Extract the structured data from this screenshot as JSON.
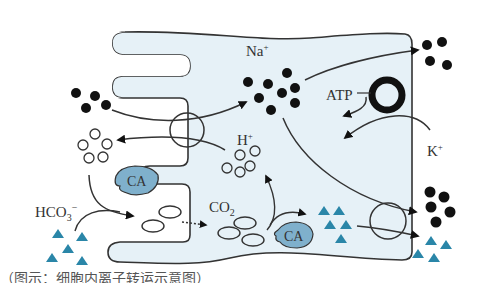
{
  "diagram": {
    "type": "gastric parietal cell ion transport schematic",
    "colors": {
      "cell_fill": "#e6f1f7",
      "outline": "#333333",
      "enzyme_fill": "#7fb0cc",
      "triangle": "#2a86a8",
      "particle": "#111111"
    },
    "labels": {
      "na": "Na",
      "na_sup": "+",
      "h": "H",
      "h_sup": "+",
      "k": "K",
      "k_sup": "+",
      "atp": "ATP",
      "co2_main": "CO",
      "co2_sub": "2",
      "hco3_main": "HCO",
      "hco3_sub": "3",
      "hco3_sup": "−",
      "ca_enzyme_1": "CA",
      "ca_enzyme_2": "CA"
    },
    "legend_symbols": {
      "filled_circle": "Na+ ion",
      "open_circle": "H+ ion",
      "triangle": "HCO3- ion",
      "open_ellipse": "CO2 molecule",
      "thick_ring": "Na+/K+ ATPase pump",
      "thin_ring": "membrane transporter"
    },
    "caption": "（图示：细胞内离子转运示意图）"
  }
}
